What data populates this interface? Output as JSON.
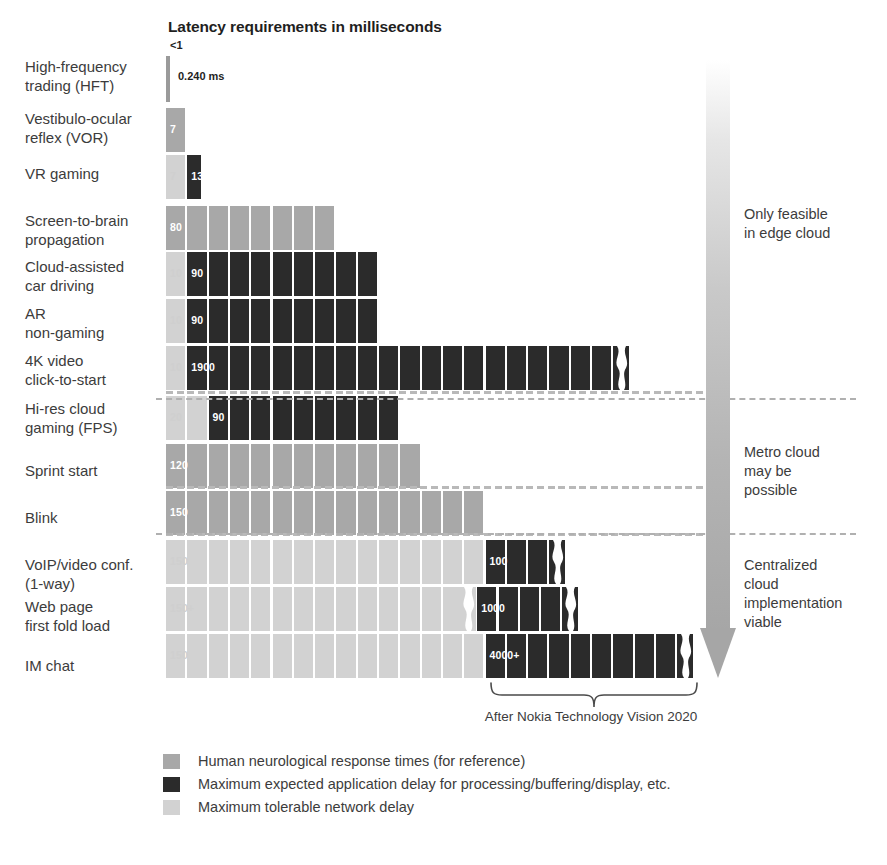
{
  "chart_data": {
    "type": "bar",
    "title": "Latency requirements in milliseconds",
    "xlabel": "",
    "ylabel": "",
    "orientation": "horizontal",
    "stacked": true,
    "grid": false,
    "legend_position": "bottom-left",
    "unit": "ms",
    "xlim": [
      0,
      4500
    ],
    "series": [
      {
        "name": "Human neurological response times (for reference)",
        "color": "#a8a8a8",
        "key": "human"
      },
      {
        "name": "Maximum expected application delay for processing/buffering/display, etc.",
        "color": "#2b2b2b",
        "key": "app"
      },
      {
        "name": "Maximum tolerable network delay",
        "color": "#d2d2d2",
        "key": "net"
      }
    ],
    "categories": [
      "High-frequency trading (HFT)",
      "Vestibulo-ocular reflex (VOR)",
      "VR gaming",
      "Screen-to-brain propagation",
      "Cloud-assisted car driving",
      "AR non-gaming",
      "4K video click-to-start",
      "Hi-res cloud gaming (FPS)",
      "Sprint start",
      "Blink",
      "VoIP/video conf. (1-way)",
      "Web page first fold load",
      "IM chat"
    ],
    "rows": [
      {
        "category": "High-frequency trading (HFT)",
        "segments": [
          {
            "series": "net",
            "value": 0.24,
            "label": ""
          }
        ],
        "top_label": "<1",
        "note": "0.240 ms",
        "hairline": true,
        "truncated": false
      },
      {
        "category": "Vestibulo-ocular reflex (VOR)",
        "segments": [
          {
            "series": "human",
            "value": 7,
            "label": "7"
          }
        ],
        "truncated": false
      },
      {
        "category": "VR gaming",
        "segments": [
          {
            "series": "net",
            "value": 7,
            "label": "7"
          },
          {
            "series": "app",
            "value": 13,
            "label": "13"
          }
        ],
        "truncated": false
      },
      {
        "category": "Screen-to-brain propagation",
        "segments": [
          {
            "series": "human",
            "value": 80,
            "label": "80"
          }
        ],
        "truncated": false
      },
      {
        "category": "Cloud-assisted car driving",
        "segments": [
          {
            "series": "net",
            "value": 10,
            "label": "10"
          },
          {
            "series": "app",
            "value": 90,
            "label": "90"
          }
        ],
        "truncated": false
      },
      {
        "category": "AR non-gaming",
        "segments": [
          {
            "series": "net",
            "value": 10,
            "label": "10"
          },
          {
            "series": "app",
            "value": 90,
            "label": "90"
          }
        ],
        "truncated": false
      },
      {
        "category": "4K video click-to-start",
        "segments": [
          {
            "series": "net",
            "value": 10,
            "label": "10"
          },
          {
            "series": "app",
            "value": 1900,
            "label": "1900"
          }
        ],
        "truncated": true
      },
      {
        "category": "Hi-res cloud gaming (FPS)",
        "segments": [
          {
            "series": "net",
            "value": 20,
            "label": "20"
          },
          {
            "series": "app",
            "value": 90,
            "label": "90"
          }
        ],
        "truncated": false
      },
      {
        "category": "Sprint start",
        "segments": [
          {
            "series": "human",
            "value": 120,
            "label": "120"
          }
        ],
        "truncated": false
      },
      {
        "category": "Blink",
        "segments": [
          {
            "series": "human",
            "value": 150,
            "label": "150"
          }
        ],
        "truncated": false
      },
      {
        "category": "VoIP/video conf. (1-way)",
        "segments": [
          {
            "series": "net",
            "value": 150,
            "label": "150"
          },
          {
            "series": "app",
            "value": 100,
            "label": "100"
          }
        ],
        "truncated": true
      },
      {
        "category": "Web page first fold load",
        "segments": [
          {
            "series": "net",
            "value": 150,
            "label": "150+"
          },
          {
            "series": "app",
            "value": 1000,
            "label": "1000"
          }
        ],
        "truncated": true
      },
      {
        "category": "IM chat",
        "segments": [
          {
            "series": "net",
            "value": 150,
            "label": "150"
          },
          {
            "series": "app",
            "value": 4000,
            "label": "4000+"
          }
        ],
        "truncated": true
      }
    ],
    "zones": [
      {
        "label": "Only feasible in edge cloud"
      },
      {
        "label": "Metro cloud may be possible"
      },
      {
        "label": "Centralized cloud implementation viable"
      }
    ],
    "annotations": [
      {
        "name": "source-caption",
        "text": "After Nokia Technology Vision 2020"
      },
      {
        "name": "hft-top-label",
        "text": "<1"
      },
      {
        "name": "hft-value-note",
        "text": "0.240 ms"
      }
    ]
  },
  "labels": {
    "rows": [
      [
        "High-frequency",
        "trading (HFT)"
      ],
      [
        "Vestibulo-ocular",
        "reflex (VOR)"
      ],
      [
        "VR gaming"
      ],
      [
        "Screen-to-brain",
        "propagation"
      ],
      [
        "Cloud-assisted",
        "car driving"
      ],
      [
        "AR",
        "non-gaming"
      ],
      [
        "4K video",
        "click-to-start"
      ],
      [
        "Hi-res cloud",
        "gaming (FPS)"
      ],
      [
        "Sprint start"
      ],
      [
        "Blink"
      ],
      [
        "VoIP/video conf.",
        "(1-way)"
      ],
      [
        "Web page",
        "first fold load"
      ],
      [
        "IM chat"
      ]
    ],
    "zones": [
      [
        "Only feasible",
        "in edge cloud"
      ],
      [
        "Metro cloud",
        "may be",
        "possible"
      ],
      [
        "Centralized",
        "cloud",
        "implementation",
        "viable"
      ]
    ]
  },
  "colors": {
    "human": "#a8a8a8",
    "app": "#2b2b2b",
    "net": "#d2d2d2",
    "text": "#3c3c3c",
    "divider": "#b0b0b0"
  }
}
